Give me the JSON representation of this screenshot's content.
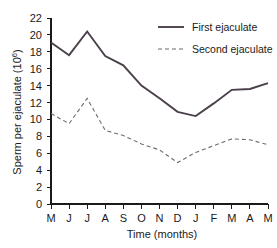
{
  "chart_data": {
    "type": "line",
    "title": "",
    "xlabel": "Time (months)",
    "ylabel": "Sperm per ejaculate (10",
    "ylabel_exponent": "6",
    "ylabel_suffix": ")",
    "categories": [
      "M",
      "J",
      "J",
      "A",
      "S",
      "O",
      "N",
      "D",
      "J",
      "F",
      "M",
      "A",
      "M"
    ],
    "x": [
      0,
      1,
      2,
      3,
      4,
      5,
      6,
      7,
      8,
      9,
      10,
      11,
      12
    ],
    "ylim": [
      0,
      22
    ],
    "yticks": [
      0,
      2,
      4,
      6,
      8,
      10,
      12,
      14,
      16,
      18,
      20,
      22
    ],
    "ytick_labels": [
      "0",
      "2",
      "4",
      "6",
      "8",
      "10",
      "12",
      "14",
      "16",
      "18",
      "20",
      "22"
    ],
    "grid": false,
    "legend_position": "top-right",
    "series": [
      {
        "name": "First ejaculate",
        "style": "solid",
        "color": "#4a3f4a",
        "width": 1.9,
        "values": [
          19.1,
          17.6,
          20.4,
          17.5,
          16.4,
          14.0,
          12.5,
          10.9,
          10.4,
          11.9,
          13.5,
          13.6,
          14.3
        ]
      },
      {
        "name": "Second ejaculate",
        "style": "dashed",
        "color": "#6b6b72",
        "width": 1.1,
        "values": [
          10.7,
          9.5,
          12.5,
          8.7,
          8.1,
          7.1,
          6.4,
          4.9,
          6.1,
          6.9,
          7.7,
          7.6,
          7.0
        ]
      }
    ]
  },
  "legend": {
    "entries": [
      {
        "label": "First ejaculate"
      },
      {
        "label": "Second ejaculate"
      }
    ]
  }
}
